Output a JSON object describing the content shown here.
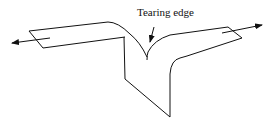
{
  "diagram": {
    "type": "tearing-specimen-illustration",
    "labels": {
      "tearing_edge": "Tearing edge"
    },
    "colors": {
      "stroke": "#111111",
      "background": "#ffffff"
    }
  }
}
